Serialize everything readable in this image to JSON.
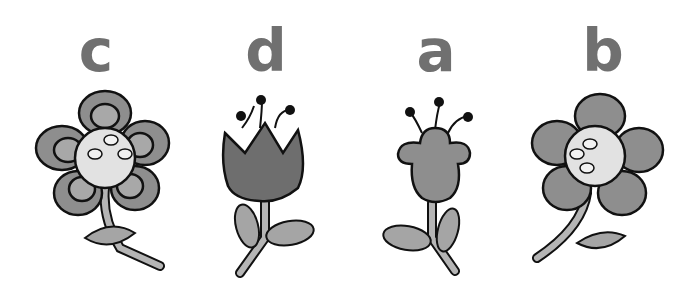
{
  "items": [
    {
      "letter": "c",
      "flower": "daisy-with-outlined-petals"
    },
    {
      "letter": "d",
      "flower": "tulip-with-stamens"
    },
    {
      "letter": "a",
      "flower": "bell-flower-with-stamens"
    },
    {
      "letter": "b",
      "flower": "daisy-with-solid-petals"
    }
  ],
  "colors": {
    "letter": "#707070",
    "petal_dark": "#6e6e6e",
    "petal_mid": "#8e8e8e",
    "petal_light": "#b5b5b5",
    "center": "#e2e2e2",
    "outline": "#111111"
  }
}
